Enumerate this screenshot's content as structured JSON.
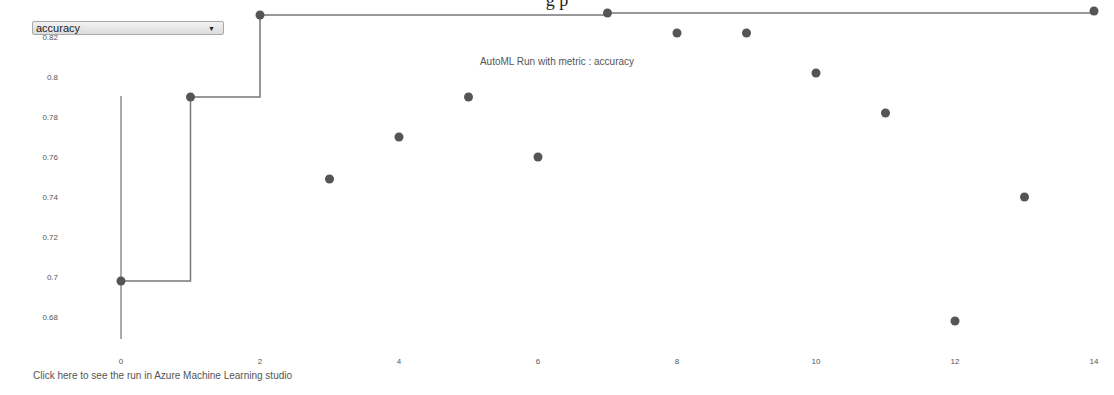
{
  "page": {
    "partial_heading": "g p"
  },
  "metric_select": {
    "value": "accuracy",
    "arrow_icon": "triangle-down"
  },
  "chart_title": "AutoML Run with metric : accuracy",
  "link_text": "Click here to see the run in Azure Machine Learning studio",
  "colors": {
    "marker": "#555555",
    "best_line": "#777777",
    "axis_line": "#555555"
  },
  "chart_data": {
    "type": "scatter",
    "title": "AutoML Run with metric : accuracy",
    "xlabel": "",
    "ylabel": "",
    "x_ticks": [
      0,
      2,
      4,
      6,
      8,
      10,
      12,
      14
    ],
    "y_ticks": [
      0.68,
      0.7,
      0.72,
      0.74,
      0.76,
      0.78,
      0.8,
      0.82,
      0.84
    ],
    "xlim": [
      -0.5,
      14.3
    ],
    "ylim": [
      0.668,
      0.85
    ],
    "grid": false,
    "legend": null,
    "series": [
      {
        "name": "run accuracy",
        "type": "scatter",
        "x": [
          0,
          1,
          2,
          3,
          4,
          5,
          6,
          7,
          8,
          9,
          10,
          11,
          12,
          13,
          14
        ],
        "y": [
          0.698,
          0.79,
          0.831,
          0.749,
          0.77,
          0.79,
          0.76,
          0.832,
          0.822,
          0.822,
          0.802,
          0.782,
          0.678,
          0.74,
          0.833
        ]
      },
      {
        "name": "best so far",
        "type": "step",
        "x": [
          0,
          1,
          2,
          3,
          4,
          5,
          6,
          7,
          8,
          9,
          10,
          11,
          12,
          13,
          14
        ],
        "y": [
          0.698,
          0.79,
          0.831,
          0.831,
          0.831,
          0.831,
          0.831,
          0.832,
          0.832,
          0.832,
          0.832,
          0.832,
          0.832,
          0.832,
          0.833
        ]
      }
    ]
  }
}
